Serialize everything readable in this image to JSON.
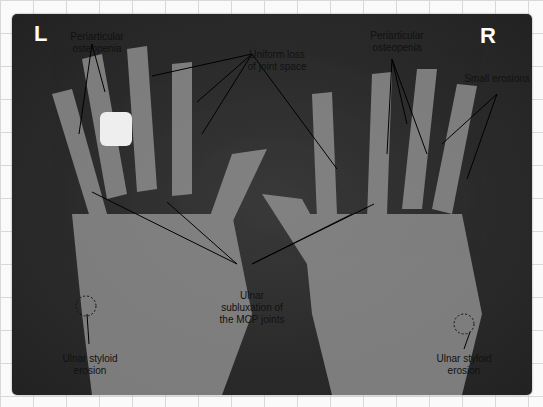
{
  "image": {
    "description": "Hand X-ray showing rheumatoid arthritis features"
  },
  "sides": {
    "left": "L",
    "right": "R"
  },
  "labels": {
    "periarticular_left_1": "Periarticular",
    "periarticular_left_2": "osteopenia",
    "uniform_1": "Uniform loss",
    "uniform_2": "of joint space",
    "periarticular_right_1": "Periarticular",
    "periarticular_right_2": "osteopenia",
    "small_erosions": "Small erosions",
    "ulnar_sub_1": "Ulnar",
    "ulnar_sub_2": "subluxation of",
    "ulnar_sub_3": "the MCP joints",
    "styloid_left_1": "Ulnar styloid",
    "styloid_left_2": "erosion",
    "styloid_right_1": "Ulnar styloid",
    "styloid_right_2": "erosion"
  }
}
